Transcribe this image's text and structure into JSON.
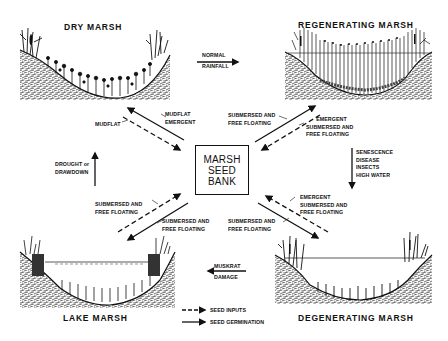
{
  "diagram": {
    "center": {
      "line1": "MARSH",
      "line2": "SEED",
      "line3": "BANK"
    },
    "stages": {
      "dry": "DRY MARSH",
      "regenerating": "REGENERATING MARSH",
      "degenerating": "DEGENERATING MARSH",
      "lake": "LAKE MARSH"
    },
    "transitions": {
      "dry_to_regen": {
        "line1": "NORMAL",
        "line2": "RAINFALL"
      },
      "regen_to_degen": {
        "line1": "SENESCENCE",
        "line2": "DISEASE",
        "line3": "INSECTS",
        "line4": "HIGH WATER"
      },
      "degen_to_lake": {
        "line1": "MUSKRAT",
        "line2": "DAMAGE"
      },
      "lake_to_dry": {
        "line1": "DROUGHT or",
        "line2": "DRAWDOWN"
      }
    },
    "flows": {
      "dry_input": "MUDFLAT",
      "dry_germ": {
        "line1": "MUDFLAT",
        "line2": "EMERGENT"
      },
      "regen_germ": {
        "line1": "SUBMERSED AND",
        "line2": "FREE FLOATING"
      },
      "regen_input": {
        "line1": "EMERGENT",
        "line2": "SUBMERSED AND",
        "line3": "FREE FLOATING"
      },
      "lake_input": {
        "line1": "SUBMERSED AND",
        "line2": "FREE FLOATING"
      },
      "lake_germ": {
        "line1": "SUBMERSED AND",
        "line2": "FREE FLOATING"
      },
      "degen_germ": {
        "line1": "SUBMERSED AND",
        "line2": "FREE FLOATING"
      },
      "degen_input": {
        "line1": "EMERGENT",
        "line2": "SUBMERSED AND",
        "line3": "FREE FLOATING"
      }
    },
    "legend": {
      "seed_inputs": "SEED INPUTS",
      "seed_germination": "SEED GERMINATION"
    },
    "colors": {
      "ink": "#111111",
      "paper": "#ffffff",
      "soil": "#8a8a8a"
    }
  }
}
